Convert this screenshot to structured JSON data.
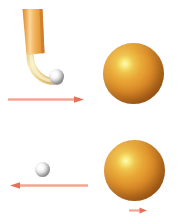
{
  "figure": {
    "background_color": "#ffffff",
    "width": 180,
    "height": 218
  },
  "colors": {
    "sphere_orange": "#df8e2a",
    "sphere_highlight": "#fdfbb8",
    "sphere_shadow": "#8e4d14",
    "stick_orange": "#f0a94a",
    "stick_light": "#f8d79a",
    "blade_cream": "#efe0a8",
    "ball_white": "#ffffff",
    "ball_shadow": "#6f6f6f",
    "arrow_salmon": "#f4a58f",
    "arrow_head": "#e8705a"
  },
  "panels": [
    {
      "id": "before-collision",
      "label": "Top panel: stick and ball approaching",
      "objects": [
        {
          "name": "hockey-stick",
          "label": "hockey stick",
          "color": "#f0a94a"
        },
        {
          "name": "small-ball",
          "label": "white ball",
          "color": "#ffffff"
        },
        {
          "name": "large-sphere",
          "label": "orange sphere",
          "color": "#df8e2a"
        }
      ],
      "arrow": {
        "name": "stick-velocity-arrow",
        "direction": "right",
        "label": "v"
      }
    },
    {
      "id": "after-collision",
      "label": "Bottom panel: ball rebounds, sphere recoils",
      "objects": [
        {
          "name": "small-ball",
          "label": "white ball",
          "color": "#ffffff"
        },
        {
          "name": "large-sphere",
          "label": "orange sphere",
          "color": "#df8e2a"
        }
      ],
      "arrows": [
        {
          "name": "ball-rebound-arrow",
          "direction": "left",
          "label": "v'"
        },
        {
          "name": "sphere-recoil-arrow",
          "direction": "right",
          "label": "V"
        }
      ]
    }
  ]
}
